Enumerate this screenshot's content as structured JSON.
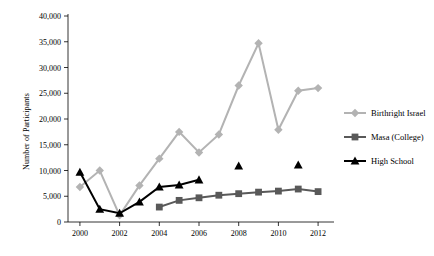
{
  "chart_data": {
    "type": "line",
    "title": "",
    "xlabel": "",
    "ylabel": "Number of Participants",
    "xlim": [
      1999.4,
      2012.6
    ],
    "ylim": [
      0,
      40000
    ],
    "grid": false,
    "legend_position": "right",
    "x_ticks": [
      "2000",
      "2002",
      "2004",
      "2006",
      "2008",
      "2010",
      "2012"
    ],
    "x_tick_values": [
      2000,
      2002,
      2004,
      2006,
      2008,
      2010,
      2012
    ],
    "y_ticks": [
      "0",
      "5,000",
      "10,000",
      "15,000",
      "20,000",
      "25,000",
      "30,000",
      "35,000",
      "40,000"
    ],
    "y_tick_values": [
      0,
      5000,
      10000,
      15000,
      20000,
      25000,
      30000,
      35000,
      40000
    ],
    "series": [
      {
        "name": "Birthright Israel",
        "color": "#b3b3b3",
        "marker": "diamond",
        "x": [
          2000,
          2001,
          2002,
          2003,
          2004,
          2005,
          2006,
          2007,
          2008,
          2009,
          2010,
          2011,
          2012
        ],
        "values": [
          6800,
          10000,
          1300,
          7100,
          12300,
          17500,
          13500,
          17000,
          26500,
          34700,
          17900,
          25500,
          26000
        ]
      },
      {
        "name": "Masa (College)",
        "color": "#595959",
        "marker": "square",
        "x": [
          2004,
          2005,
          2006,
          2007,
          2008,
          2009,
          2010,
          2011,
          2012
        ],
        "values": [
          2900,
          4200,
          4700,
          5200,
          5500,
          5800,
          6000,
          6400,
          5900
        ]
      },
      {
        "name": "High School",
        "color": "#000000",
        "marker": "triangle",
        "x": [
          2000,
          2001,
          2002,
          2003,
          2004,
          2005,
          2006,
          2008,
          2011
        ],
        "values": [
          9700,
          2500,
          1700,
          3900,
          6800,
          7200,
          8200,
          10900,
          11100
        ]
      }
    ],
    "series_extra_note": ""
  },
  "legend": {
    "items": [
      {
        "label": "Birthright Israel",
        "color": "#b3b3b3",
        "marker": "diamond"
      },
      {
        "label": "Masa (College)",
        "color": "#595959",
        "marker": "square"
      },
      {
        "label": "High School",
        "color": "#000000",
        "marker": "triangle"
      }
    ]
  },
  "axis": {
    "y_title": "Number of Participants"
  }
}
